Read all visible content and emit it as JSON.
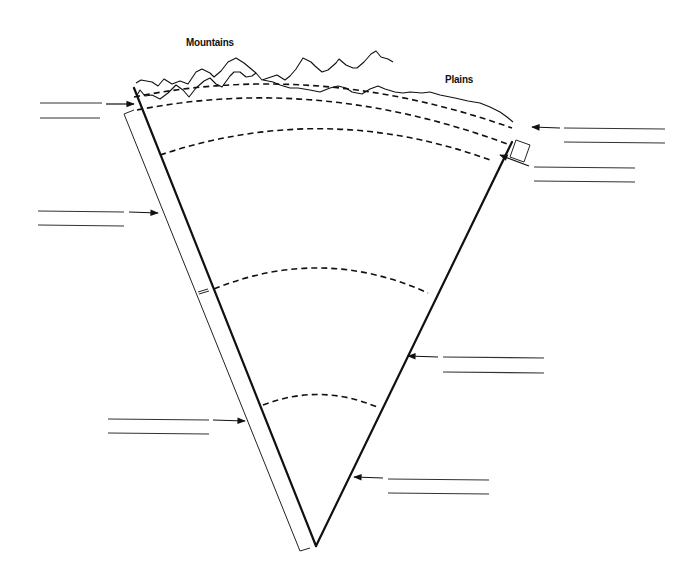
{
  "diagram": {
    "labels": {
      "mountains": "Mountains",
      "plains": "Plains"
    },
    "colors": {
      "line": "#111111",
      "background": "#ffffff"
    },
    "blanks": [
      {
        "id": "blank-1",
        "side": "left",
        "arrow_target": "crust-surface-left",
        "lines": [
          {
            "x1": 40,
            "x2": 102,
            "y": 103
          },
          {
            "x1": 40,
            "x2": 100,
            "y": 118
          }
        ],
        "value": ""
      },
      {
        "id": "blank-2",
        "side": "right",
        "arrow_target": "oceanic-crust-box",
        "lines": [
          {
            "x1": 564,
            "x2": 665,
            "y": 128
          },
          {
            "x1": 564,
            "x2": 665,
            "y": 142
          }
        ],
        "value": ""
      },
      {
        "id": "blank-3",
        "side": "right",
        "arrow_target": "upper-mantle-boundary",
        "lines": [
          {
            "x1": 534,
            "x2": 635,
            "y": 167
          },
          {
            "x1": 534,
            "x2": 635,
            "y": 181
          }
        ],
        "value": ""
      },
      {
        "id": "blank-4",
        "side": "left",
        "arrow_target": "lithosphere-strip",
        "lines": [
          {
            "x1": 38,
            "x2": 124,
            "y": 211
          },
          {
            "x1": 38,
            "x2": 124,
            "y": 225
          }
        ],
        "value": ""
      },
      {
        "id": "blank-5",
        "side": "right",
        "arrow_target": "outer-core-edge",
        "lines": [
          {
            "x1": 443,
            "x2": 544,
            "y": 357
          },
          {
            "x1": 443,
            "x2": 544,
            "y": 372
          }
        ],
        "value": ""
      },
      {
        "id": "blank-6",
        "side": "left",
        "arrow_target": "strip-lower",
        "lines": [
          {
            "x1": 108,
            "x2": 209,
            "y": 419
          },
          {
            "x1": 108,
            "x2": 209,
            "y": 433
          }
        ],
        "value": ""
      },
      {
        "id": "blank-7",
        "side": "right",
        "arrow_target": "inner-core-edge",
        "lines": [
          {
            "x1": 388,
            "x2": 489,
            "y": 479
          },
          {
            "x1": 388,
            "x2": 489,
            "y": 493
          }
        ],
        "value": ""
      }
    ],
    "layers": [
      {
        "name": "crust-top-boundary",
        "style": "dashed"
      },
      {
        "name": "crust-bottom-boundary",
        "style": "dashed"
      },
      {
        "name": "upper-mantle-boundary",
        "style": "dashed"
      },
      {
        "name": "mantle-core-boundary",
        "style": "dashed"
      },
      {
        "name": "inner-core-boundary",
        "style": "dashed"
      }
    ]
  }
}
